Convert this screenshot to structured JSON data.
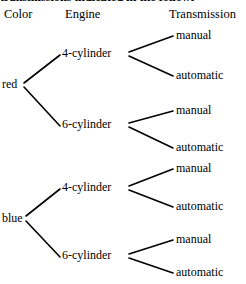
{
  "figure": {
    "caption": "transmissions indicated in the followi",
    "background_color": "#ffffff",
    "line_color": "#000000",
    "text_color": "#000000"
  },
  "headers": {
    "level1": "Color",
    "level2": "Engine",
    "level3": "Transmission"
  },
  "tree": {
    "type": "tree-diagram",
    "levels": [
      "Color",
      "Engine",
      "Transmission"
    ],
    "nodes": {
      "colors": [
        "red",
        "blue"
      ],
      "engines": [
        "4-cylinder",
        "6-cylinder",
        "4-cylinder",
        "6-cylinder"
      ],
      "transmissions": [
        "manual",
        "automatic",
        "manual",
        "automatic",
        "manual",
        "automatic",
        "manual",
        "automatic"
      ]
    },
    "branches": [
      {
        "color": "red",
        "engine": "4-cylinder",
        "transmission": "manual"
      },
      {
        "color": "red",
        "engine": "4-cylinder",
        "transmission": "automatic"
      },
      {
        "color": "red",
        "engine": "6-cylinder",
        "transmission": "manual"
      },
      {
        "color": "red",
        "engine": "6-cylinder",
        "transmission": "automatic"
      },
      {
        "color": "blue",
        "engine": "4-cylinder",
        "transmission": "manual"
      },
      {
        "color": "blue",
        "engine": "4-cylinder",
        "transmission": "automatic"
      },
      {
        "color": "blue",
        "engine": "6-cylinder",
        "transmission": "manual"
      },
      {
        "color": "blue",
        "engine": "6-cylinder",
        "transmission": "automatic"
      }
    ],
    "total_outcomes": 8
  }
}
